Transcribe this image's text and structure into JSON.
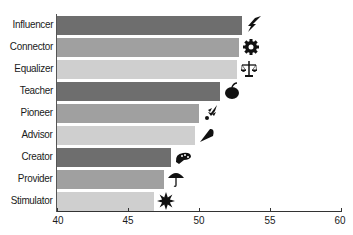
{
  "chart_data": {
    "type": "bar",
    "orientation": "horizontal",
    "title": "",
    "xlabel": "",
    "ylabel": "",
    "xlim": [
      40,
      60
    ],
    "grid": false,
    "legend": null,
    "categories": [
      "Influencer",
      "Connector",
      "Equalizer",
      "Teacher",
      "Pioneer",
      "Advisor",
      "Creator",
      "Provider",
      "Stimulator"
    ],
    "values": [
      53.0,
      52.8,
      52.7,
      51.5,
      50.0,
      49.7,
      48.0,
      47.5,
      46.8
    ],
    "bar_colors": [
      "#6e6e6e",
      "#a0a0a0",
      "#cfcfcf",
      "#6e6e6e",
      "#a0a0a0",
      "#cfcfcf",
      "#6e6e6e",
      "#a0a0a0",
      "#cfcfcf"
    ],
    "icons": [
      "lightning-bolt-icon",
      "gear-icon",
      "scales-icon",
      "apple-icon",
      "rocket-icon",
      "megaphone-icon",
      "paint-palette-icon",
      "umbrella-icon",
      "starburst-icon"
    ],
    "x_ticks": [
      40,
      45,
      50,
      55,
      60
    ],
    "x_tick_labels": [
      "40",
      "45",
      "50",
      "55",
      "60"
    ]
  }
}
